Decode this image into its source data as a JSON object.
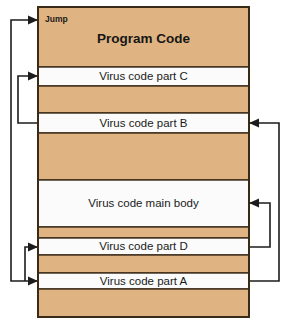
{
  "diagram": {
    "title": "Program Code",
    "jump_label": "Jump",
    "colors": {
      "program_code_fill": "#E0B482",
      "virus_code_fill": "#FBFBFB",
      "border": "#3A2A18",
      "arrow": "#1C1C1C",
      "text": "#1A1A1A",
      "background": "#FFFFFF"
    },
    "block": {
      "x": 38,
      "y": 7,
      "width": 211,
      "height": 310
    },
    "bands": [
      {
        "id": "program-code-top",
        "kind": "program",
        "label": "Program Code",
        "y": 7,
        "height": 60
      },
      {
        "id": "virus-part-c",
        "kind": "virus",
        "label": "Virus code part C",
        "y": 67,
        "height": 19
      },
      {
        "id": "program-code-gap-1",
        "kind": "program",
        "label": "",
        "y": 86,
        "height": 27
      },
      {
        "id": "virus-part-b",
        "kind": "virus",
        "label": "Virus code part B",
        "y": 113,
        "height": 20
      },
      {
        "id": "program-code-gap-2",
        "kind": "program",
        "label": "",
        "y": 133,
        "height": 47
      },
      {
        "id": "virus-main-body",
        "kind": "virus",
        "label": "Virus code main body",
        "y": 180,
        "height": 47
      },
      {
        "id": "program-code-gap-3",
        "kind": "program",
        "label": "",
        "y": 227,
        "height": 11
      },
      {
        "id": "virus-part-d",
        "kind": "virus",
        "label": "Virus code part D",
        "y": 238,
        "height": 17
      },
      {
        "id": "program-code-gap-4",
        "kind": "program",
        "label": "",
        "y": 255,
        "height": 18
      },
      {
        "id": "virus-part-a",
        "kind": "virus",
        "label": "Virus code part A",
        "y": 273,
        "height": 16
      },
      {
        "id": "program-code-bottom",
        "kind": "program",
        "label": "",
        "y": 289,
        "height": 28
      }
    ],
    "flows": [
      {
        "id": "flow-a-to-jump",
        "name": "jump-flow-part-a-to-program-start",
        "from": "virus-part-a",
        "to": "program-code-top",
        "side": "left",
        "path": "M 38 281 L 11 281 L 11 20 L 38 20"
      },
      {
        "id": "flow-b-to-c",
        "name": "jump-flow-part-b-to-part-c",
        "from": "virus-part-b",
        "to": "virus-part-c",
        "side": "left",
        "path": "M 38 123 L 18 123 L 18 76 L 38 76"
      },
      {
        "id": "flow-outer-left-to-d",
        "name": "jump-flow-to-part-d",
        "from": "virus-part-a",
        "to": "virus-part-d",
        "side": "left",
        "path": "M 25 281 L 25 247 L 38 247"
      },
      {
        "id": "flow-main-to-d",
        "name": "jump-flow-main-body-to-part-d",
        "from": "virus-main-body",
        "to": "virus-part-d",
        "side": "right",
        "path": "M 249 247 L 270 247 L 270 203 L 249 203"
      },
      {
        "id": "flow-a-to-b",
        "name": "jump-flow-part-a-to-part-b",
        "from": "virus-part-a",
        "to": "virus-part-b",
        "side": "right",
        "path": "M 249 281 L 279 281 L 279 123 L 249 123"
      }
    ],
    "arrow_heads": [
      {
        "id": "arrow-into-jump",
        "name": "arrowhead-into-program-start",
        "x": 38,
        "y": 20,
        "dir": "right"
      },
      {
        "id": "arrow-into-c",
        "name": "arrowhead-into-part-c",
        "x": 38,
        "y": 76,
        "dir": "right"
      },
      {
        "id": "arrow-into-d-left",
        "name": "arrowhead-into-part-d",
        "x": 38,
        "y": 247,
        "dir": "right"
      },
      {
        "id": "arrow-into-a-left",
        "name": "arrowhead-into-part-a",
        "x": 38,
        "y": 281,
        "dir": "right"
      },
      {
        "id": "arrow-into-b-right",
        "name": "arrowhead-into-part-b",
        "x": 249,
        "y": 123,
        "dir": "left"
      },
      {
        "id": "arrow-into-main-right",
        "name": "arrowhead-into-main-body",
        "x": 249,
        "y": 203,
        "dir": "left"
      }
    ]
  }
}
